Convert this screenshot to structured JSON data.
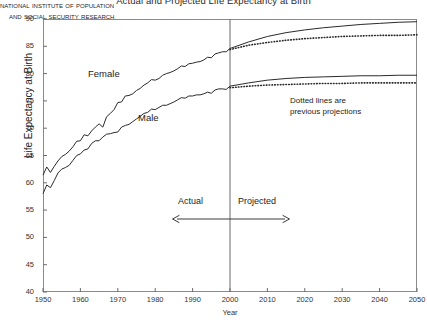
{
  "chart_data": {
    "type": "line",
    "title": "Actual and Projected Life Expectancy at Birth",
    "xlabel": "Year",
    "ylabel": "Life Expectancy at Birth",
    "xlim": [
      1950,
      2050
    ],
    "ylim": [
      40,
      90
    ],
    "xticks": [
      1950,
      1960,
      1970,
      1980,
      1990,
      2000,
      2010,
      2020,
      2030,
      2040,
      2050
    ],
    "yticks": [
      40,
      45,
      50,
      55,
      60,
      65,
      70,
      75,
      80,
      85,
      90
    ],
    "grid": false,
    "legend": "none",
    "divider_year": 2000,
    "annotations": [
      {
        "name": "female-label",
        "text": "Female",
        "x": 1963,
        "y": 77.5
      },
      {
        "name": "male-label",
        "text": "Male",
        "x": 1977,
        "y": 69.5
      },
      {
        "name": "dotted-note",
        "line1": "Dotted lines are",
        "line2": "previous projections",
        "x": 2018,
        "y": 73.5
      },
      {
        "name": "actual-label",
        "text": "Actual",
        "x": 1988,
        "y": 54.5
      },
      {
        "name": "projected-label",
        "text": "Projected",
        "x": 2010,
        "y": 54.5
      },
      {
        "name": "credit-line1",
        "text": "National Institute of Population"
      },
      {
        "name": "credit-line2",
        "text": "and Social Security Research"
      }
    ],
    "series": [
      {
        "name": "Female actual",
        "style": "solid",
        "segment": "actual",
        "x": [
          1950,
          1951,
          1952,
          1953,
          1954,
          1955,
          1956,
          1957,
          1958,
          1959,
          1960,
          1961,
          1962,
          1963,
          1964,
          1965,
          1966,
          1967,
          1968,
          1969,
          1970,
          1971,
          1972,
          1973,
          1974,
          1975,
          1976,
          1977,
          1978,
          1979,
          1980,
          1981,
          1982,
          1983,
          1984,
          1985,
          1986,
          1987,
          1988,
          1989,
          1990,
          1991,
          1992,
          1993,
          1994,
          1995,
          1996,
          1997,
          1998,
          1999,
          2000
        ],
        "values": [
          61.4,
          62.9,
          61.9,
          63.0,
          64.0,
          64.8,
          65.2,
          65.8,
          66.6,
          67.6,
          67.7,
          68.8,
          68.6,
          69.5,
          70.2,
          70.8,
          70.2,
          72.1,
          72.7,
          73.4,
          74.7,
          74.8,
          75.9,
          76.0,
          76.3,
          76.9,
          77.3,
          77.9,
          78.3,
          78.9,
          78.8,
          79.1,
          79.7,
          80.0,
          80.2,
          80.5,
          80.9,
          81.4,
          81.3,
          81.8,
          81.9,
          82.1,
          82.2,
          82.5,
          83.0,
          82.9,
          83.6,
          83.8,
          84.0,
          84.0,
          84.6
        ]
      },
      {
        "name": "Male actual",
        "style": "solid",
        "segment": "actual",
        "x": [
          1950,
          1951,
          1952,
          1953,
          1954,
          1955,
          1956,
          1957,
          1958,
          1959,
          1960,
          1961,
          1962,
          1963,
          1964,
          1965,
          1966,
          1967,
          1968,
          1969,
          1970,
          1971,
          1972,
          1973,
          1974,
          1975,
          1976,
          1977,
          1978,
          1979,
          1980,
          1981,
          1982,
          1983,
          1984,
          1985,
          1986,
          1987,
          1988,
          1989,
          1990,
          1991,
          1992,
          1993,
          1994,
          1995,
          1996,
          1997,
          1998,
          1999,
          2000
        ],
        "values": [
          58.0,
          59.6,
          59.1,
          60.4,
          61.8,
          62.5,
          62.8,
          63.2,
          64.1,
          65.0,
          65.3,
          66.0,
          66.2,
          67.2,
          67.7,
          67.7,
          68.4,
          68.9,
          69.0,
          69.2,
          69.3,
          70.2,
          70.5,
          70.7,
          71.2,
          71.7,
          72.2,
          72.7,
          72.9,
          73.5,
          73.4,
          73.8,
          74.2,
          74.2,
          74.5,
          74.8,
          75.2,
          75.6,
          75.5,
          75.9,
          75.9,
          76.1,
          76.1,
          76.3,
          76.6,
          76.4,
          77.0,
          77.2,
          77.2,
          77.1,
          77.7
        ]
      },
      {
        "name": "Female projected (current)",
        "style": "solid",
        "segment": "projected",
        "x": [
          2000,
          2005,
          2010,
          2015,
          2020,
          2025,
          2030,
          2035,
          2040,
          2045,
          2050
        ],
        "values": [
          84.6,
          85.8,
          86.8,
          87.5,
          88.0,
          88.4,
          88.7,
          89.0,
          89.2,
          89.4,
          89.5
        ]
      },
      {
        "name": "Male projected (current)",
        "style": "solid",
        "segment": "projected",
        "x": [
          2000,
          2005,
          2010,
          2015,
          2020,
          2025,
          2030,
          2035,
          2040,
          2045,
          2050
        ],
        "values": [
          77.7,
          78.3,
          78.8,
          79.1,
          79.3,
          79.4,
          79.5,
          79.6,
          79.6,
          79.7,
          79.7
        ]
      },
      {
        "name": "Female previous projection",
        "style": "dotted",
        "segment": "projected",
        "x": [
          2000,
          2005,
          2010,
          2015,
          2020,
          2025,
          2030,
          2035,
          2040,
          2045,
          2050
        ],
        "values": [
          84.4,
          85.2,
          85.7,
          86.1,
          86.4,
          86.6,
          86.8,
          86.9,
          87.0,
          87.0,
          87.1
        ]
      },
      {
        "name": "Male previous projection",
        "style": "dotted",
        "segment": "projected",
        "x": [
          2000,
          2005,
          2010,
          2015,
          2020,
          2025,
          2030,
          2035,
          2040,
          2045,
          2050
        ],
        "values": [
          77.4,
          77.7,
          77.9,
          78.0,
          78.1,
          78.2,
          78.2,
          78.3,
          78.3,
          78.3,
          78.3
        ]
      }
    ]
  },
  "axis": {
    "ylabel": "Life Expectancy at Birth",
    "xlabel": "Year"
  },
  "labels": {
    "title": "Actual and Projected Life Expectancy at Birth",
    "female": "Female",
    "male": "Male",
    "dotted_note_1": "Dotted lines are",
    "dotted_note_2": "previous projections",
    "actual": "Actual",
    "projected": "Projected",
    "credit_1": "National Institute of Population",
    "credit_2": "and Social Security Research"
  },
  "yticks": [
    "90",
    "85",
    "80",
    "75",
    "70",
    "65",
    "60",
    "55",
    "50",
    "45",
    "40"
  ],
  "xticks": [
    "1950",
    "1960",
    "1970",
    "1980",
    "1990",
    "2000",
    "2010",
    "2020",
    "2030",
    "2040",
    "2050"
  ]
}
